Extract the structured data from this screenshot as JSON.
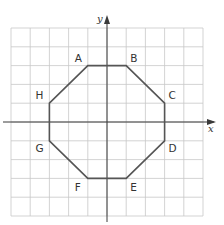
{
  "diagram": {
    "type": "coordinate-grid-polygon",
    "shape": "octagon",
    "grid": {
      "columns": 10,
      "rows": 10,
      "x_range": [
        -5,
        5
      ],
      "y_range": [
        -5,
        5
      ]
    },
    "axes": {
      "x_label": "x",
      "y_label": "y"
    },
    "vertices": [
      {
        "label": "A",
        "x": -1,
        "y": 3
      },
      {
        "label": "B",
        "x": 1,
        "y": 3
      },
      {
        "label": "C",
        "x": 3,
        "y": 1
      },
      {
        "label": "D",
        "x": 3,
        "y": -1
      },
      {
        "label": "E",
        "x": 1,
        "y": -3
      },
      {
        "label": "F",
        "x": -1,
        "y": -3
      },
      {
        "label": "G",
        "x": -3,
        "y": -1
      },
      {
        "label": "H",
        "x": -3,
        "y": 1
      }
    ],
    "colors": {
      "grid": "#c8c8c8",
      "axes": "#3a3a3a",
      "polygon": "#555555",
      "text": "#333333"
    }
  }
}
